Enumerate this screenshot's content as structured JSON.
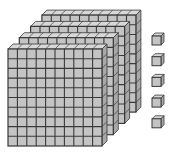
{
  "diagram": {
    "type": "base-ten-blocks",
    "hundreds_flats": 4,
    "units": 5,
    "represented_value": 405,
    "flat_grid": 10,
    "colors": {
      "face": "#c4c4c4",
      "side": "#a8a8a8",
      "top": "#d8d8d8",
      "line": "#3a3a3a",
      "background": "#ffffff"
    }
  }
}
